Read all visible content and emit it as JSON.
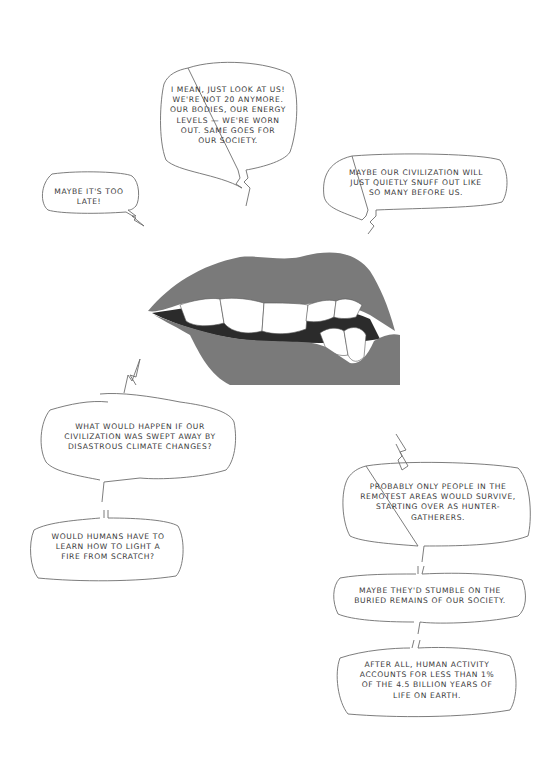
{
  "colors": {
    "lip": "#7a7a7a",
    "line": "#6e6e6e",
    "text": "#3a3a3a",
    "background": "#ffffff",
    "teeth": "#ffffff"
  },
  "illustration": {
    "subject": "bitten-lip-icon"
  },
  "bubbles": [
    {
      "id": "look-at-us",
      "lines": [
        "I MEAN, JUST LOOK AT US!",
        "WE'RE NOT 20 ANYMORE.",
        "OUR BODIES, OUR ENERGY",
        "LEVELS — WE'RE WORN",
        "OUT. SAME GOES FOR",
        "OUR SOCIETY."
      ]
    },
    {
      "id": "too-late",
      "lines": [
        "MAYBE IT'S TOO",
        "LATE!"
      ]
    },
    {
      "id": "snuff-out",
      "lines": [
        "MAYBE OUR CIVILIZATION WILL",
        "JUST QUIETLY SNUFF OUT LIKE",
        "SO MANY BEFORE US."
      ]
    },
    {
      "id": "climate",
      "lines": [
        "WHAT WOULD HAPPEN IF OUR",
        "CIVILIZATION WAS SWEPT AWAY BY",
        "DISASTROUS CLIMATE CHANGES?"
      ]
    },
    {
      "id": "fire",
      "lines": [
        "WOULD HUMANS HAVE TO",
        "LEARN HOW TO LIGHT A",
        "FIRE FROM SCRATCH?"
      ]
    },
    {
      "id": "survive",
      "lines": [
        "PROBABLY ONLY PEOPLE IN THE",
        "REMOTEST AREAS WOULD SURVIVE,",
        "STARTING OVER AS HUNTER-",
        "GATHERERS."
      ]
    },
    {
      "id": "remains",
      "lines": [
        "MAYBE THEY'D STUMBLE ON THE",
        "BURIED REMAINS OF OUR SOCIETY."
      ]
    },
    {
      "id": "human-activity",
      "lines": [
        "AFTER ALL, HUMAN ACTIVITY",
        "ACCOUNTS FOR LESS THAN 1%",
        "OF THE 4.5 BILLION YEARS OF",
        "LIFE ON EARTH."
      ]
    }
  ]
}
